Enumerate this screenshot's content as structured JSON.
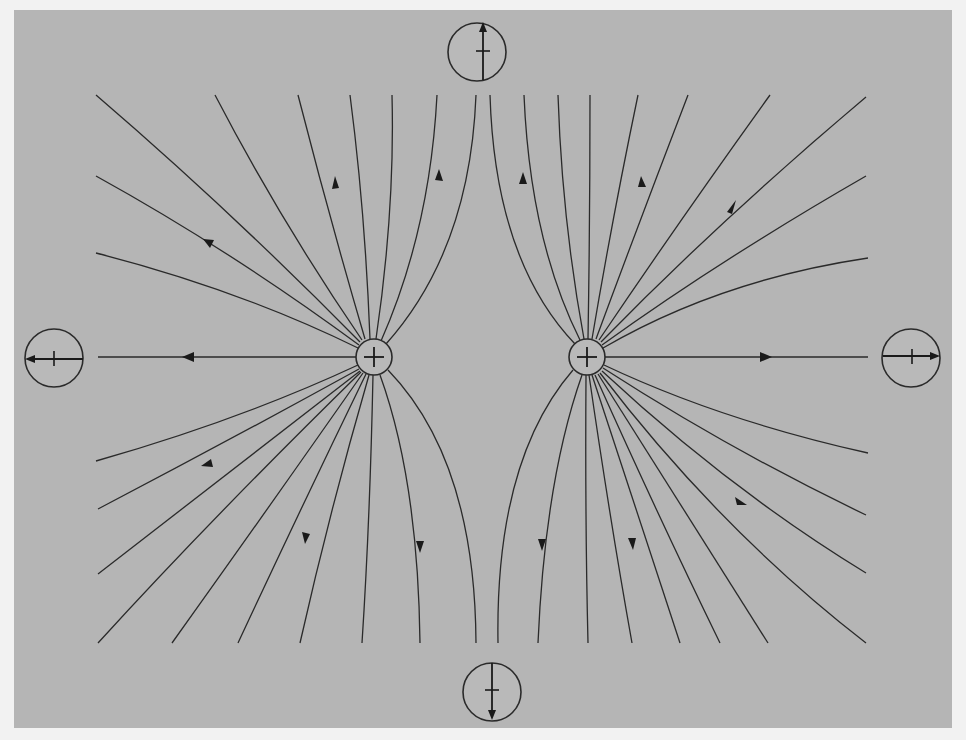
{
  "diagram": {
    "type": "electric-field-lines",
    "background_color": "#b5b5b5",
    "line_color": "#2a2a2a",
    "charges": [
      {
        "id": "left",
        "sign": "+",
        "cx": 374,
        "cy": 357,
        "r": 18
      },
      {
        "id": "right",
        "sign": "+",
        "cx": 587,
        "cy": 357,
        "r": 18
      }
    ],
    "compasses": [
      {
        "id": "top",
        "cx": 477,
        "cy": 52,
        "r": 29,
        "needle_direction": "up"
      },
      {
        "id": "bottom",
        "cx": 492,
        "cy": 692,
        "r": 29,
        "needle_direction": "down"
      },
      {
        "id": "left",
        "cx": 54,
        "cy": 357,
        "r": 29,
        "needle_direction": "left"
      },
      {
        "id": "right",
        "cx": 911,
        "cy": 357,
        "r": 29,
        "needle_direction": "right"
      }
    ],
    "field_line_count": {
      "left_charge": 17,
      "right_charge": 17
    },
    "arrow_direction": "outward from charges"
  }
}
